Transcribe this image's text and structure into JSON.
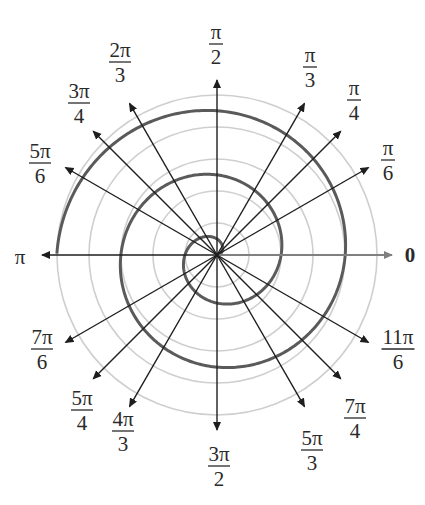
{
  "diagram": {
    "type": "polar-graph",
    "center": {
      "x": 217,
      "y": 255
    },
    "grid_circle_radii": [
      32,
      64,
      96,
      128,
      160
    ],
    "ray_length": 175,
    "spiral": {
      "equation": "r = θ",
      "theta_start": 0,
      "theta_end_pi_multiple": 5,
      "pixel_scale_per_radian": 10.2
    },
    "colors": {
      "spiral": "#5a5a5a",
      "grid": "#cfcfcf",
      "rays": "#1e1e1e",
      "zero_ray": "#808080",
      "text": "#2a2a2a"
    },
    "angles": [
      {
        "id": "0",
        "deg": 0,
        "label": {
          "num": "0",
          "den": ""
        },
        "pos": [
          410,
          256
        ]
      },
      {
        "id": "pi-6",
        "deg": 30,
        "label": {
          "num": "π",
          "den": "6"
        },
        "pos": [
          388,
          160
        ]
      },
      {
        "id": "pi-4",
        "deg": 45,
        "label": {
          "num": "π",
          "den": "4"
        },
        "pos": [
          354,
          100
        ]
      },
      {
        "id": "pi-3",
        "deg": 60,
        "label": {
          "num": "π",
          "den": "3"
        },
        "pos": [
          310,
          67
        ]
      },
      {
        "id": "pi-2",
        "deg": 90,
        "label": {
          "num": "π",
          "den": "2"
        },
        "pos": [
          216,
          44
        ]
      },
      {
        "id": "2pi-3",
        "deg": 120,
        "label": {
          "num": "2π",
          "den": "3"
        },
        "pos": [
          120,
          62
        ]
      },
      {
        "id": "3pi-4",
        "deg": 135,
        "label": {
          "num": "3π",
          "den": "4"
        },
        "pos": [
          79,
          103
        ]
      },
      {
        "id": "5pi-6",
        "deg": 150,
        "label": {
          "num": "5π",
          "den": "6"
        },
        "pos": [
          40,
          163
        ]
      },
      {
        "id": "pi",
        "deg": 180,
        "label": {
          "num": "π",
          "den": ""
        },
        "pos": [
          20,
          258
        ]
      },
      {
        "id": "7pi-6",
        "deg": 210,
        "label": {
          "num": "7π",
          "den": "6"
        },
        "pos": [
          42,
          349
        ]
      },
      {
        "id": "5pi-4",
        "deg": 225,
        "label": {
          "num": "5π",
          "den": "4"
        },
        "pos": [
          82,
          410
        ]
      },
      {
        "id": "4pi-3",
        "deg": 240,
        "label": {
          "num": "4π",
          "den": "3"
        },
        "pos": [
          123,
          431
        ]
      },
      {
        "id": "3pi-2",
        "deg": 270,
        "label": {
          "num": "3π",
          "den": "2"
        },
        "pos": [
          219,
          466
        ]
      },
      {
        "id": "5pi-3",
        "deg": 300,
        "label": {
          "num": "5π",
          "den": "3"
        },
        "pos": [
          312,
          450
        ]
      },
      {
        "id": "7pi-4",
        "deg": 315,
        "label": {
          "num": "7π",
          "den": "4"
        },
        "pos": [
          355,
          418
        ]
      },
      {
        "id": "11pi-6",
        "deg": 330,
        "label": {
          "num": "11π",
          "den": "6"
        },
        "pos": [
          398,
          349
        ]
      }
    ]
  }
}
